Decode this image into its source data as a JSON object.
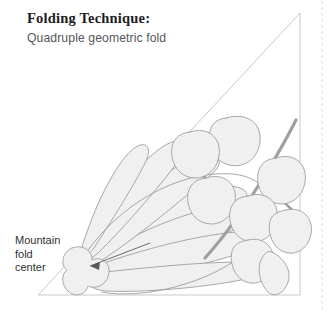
{
  "page": {
    "width": 333,
    "height": 312,
    "background": "#ffffff"
  },
  "header": {
    "title": "Folding Technique:",
    "subtitle": "Quadruple geometric fold",
    "title_color": "#1d1d1f",
    "subtitle_color": "#56565a"
  },
  "callout": {
    "line1": "Mountain",
    "line2": "fold",
    "line3": "center",
    "color": "#2f2f33"
  },
  "diagram": {
    "name": "origami-folding-diagram",
    "triangle": {
      "label": "paper-triangle-outline",
      "points": "38,295 300,295 300,13",
      "stroke": "#c9c9cc",
      "fill": "none",
      "stroke_width": 1
    },
    "dotted_guide": {
      "label": "right-margin-dotted-line",
      "x": 322,
      "y_start": 2,
      "y_end": 310,
      "color": "#d7d7da",
      "dash": "1,5"
    },
    "shape_style": {
      "fill": "#f0f0f1",
      "stroke": "#9e9ea3",
      "stroke_width": 0.9
    },
    "fold_center": {
      "label": "mountain-fold-center-blob",
      "cx": 78,
      "cy": 268
    },
    "pointer": {
      "label": "callout-pointer-arrow",
      "from_x": 150,
      "from_y": 243,
      "to_x": 88,
      "to_y": 266
    },
    "fan_petal_count": 7,
    "leaf_cluster_count": 9
  },
  "colors": {
    "paper_outline": "#c9c9cc",
    "shape_fill": "#f0f0f1",
    "shape_stroke": "#9e9ea3",
    "dotted_guide": "#d7d7da",
    "background": "#ffffff"
  }
}
